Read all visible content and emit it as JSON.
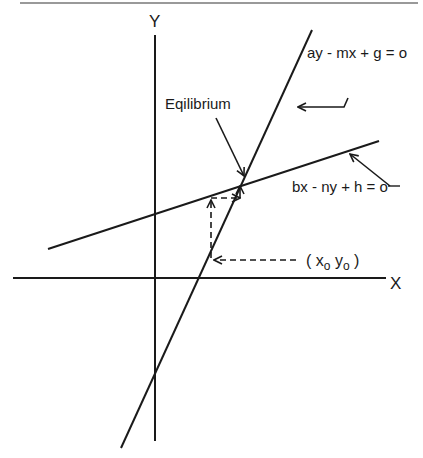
{
  "diagram": {
    "type": "economic equilibrium diagram (two linear equations)",
    "axes": {
      "x_label": "X",
      "y_label": "Y"
    },
    "lines": [
      {
        "id": "steep",
        "equation": "ay - mx + g = o"
      },
      {
        "id": "shallow",
        "equation": "bx - ny + h = o"
      }
    ],
    "annotations": {
      "equilibrium_label": "Eqilibrium",
      "start_point_label": "( x",
      "start_point_x_sub": "o",
      "start_point_y": " y",
      "start_point_y_sub": "o",
      "start_point_close": " )"
    },
    "colors": {
      "ink": "#1a1a1a",
      "background": "#ffffff"
    }
  }
}
